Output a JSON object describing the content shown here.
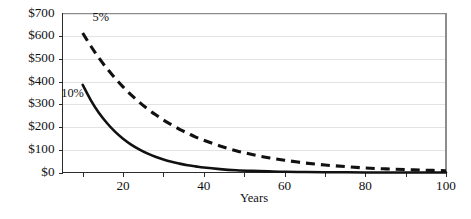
{
  "chart_data": {
    "type": "line",
    "title": "",
    "subtitle": "",
    "xlabel": "Years",
    "ylabel": "",
    "xlim": [
      5,
      100
    ],
    "ylim": [
      0,
      700
    ],
    "grid": true,
    "grid_axis": "y",
    "legend_position": "inline-annotation",
    "x_ticks_major": [
      20,
      40,
      60,
      80,
      100
    ],
    "x_ticks_minor": [
      10,
      30,
      50,
      70,
      90
    ],
    "x_tick_labels": [
      "20",
      "40",
      "60",
      "80",
      "100"
    ],
    "y_ticks": [
      0,
      100,
      200,
      300,
      400,
      500,
      600,
      700
    ],
    "y_tick_labels": [
      "$0",
      "$100",
      "$200",
      "$300",
      "$400",
      "$500",
      "$600",
      "$700"
    ],
    "x": [
      10,
      12,
      14,
      16,
      18,
      20,
      22,
      24,
      26,
      28,
      30,
      32,
      34,
      36,
      38,
      40,
      44,
      48,
      52,
      56,
      60,
      65,
      70,
      75,
      80,
      85,
      90,
      95,
      100
    ],
    "series": [
      {
        "name": "5%",
        "label": "5%",
        "style": "dashed",
        "color": "#111111",
        "annotation": "5%",
        "values": [
          614,
          557,
          505,
          458,
          416,
          377,
          342,
          310,
          281,
          255,
          231,
          210,
          190,
          173,
          156,
          142,
          117,
          96,
          79,
          65,
          54,
          42,
          33,
          26,
          20,
          16,
          13,
          10,
          8
        ]
      },
      {
        "name": "10%",
        "label": "10%",
        "style": "solid",
        "color": "#111111",
        "annotation": "10%",
        "values": [
          386,
          319,
          263,
          218,
          180,
          149,
          123,
          102,
          84,
          69,
          57,
          47,
          39,
          32,
          27,
          22,
          15,
          10,
          7,
          5,
          3,
          2,
          1,
          1,
          0,
          0,
          0,
          0,
          0
        ]
      }
    ],
    "annotations": [
      {
        "text": "5%",
        "x_pos": 14.5,
        "y_pos": 680
      },
      {
        "text": "10%",
        "x_pos": 7.5,
        "y_pos": 345
      }
    ]
  }
}
